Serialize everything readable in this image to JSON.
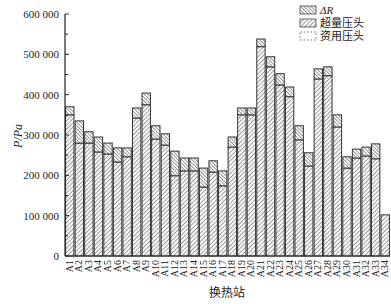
{
  "chart_data": {
    "type": "bar",
    "stacked": true,
    "title": "",
    "xlabel": "换热站",
    "ylabel": "P/Pa",
    "ylim": [
      0,
      600000
    ],
    "yticks": [
      0,
      100000,
      200000,
      300000,
      400000,
      500000,
      600000
    ],
    "ytick_labels": [
      "0",
      "100 000",
      "200 000",
      "300 000",
      "400 000",
      "500 000",
      "600 000"
    ],
    "grid": false,
    "legend_position": "top-right",
    "legend": [
      {
        "name": "ΔR",
        "pattern": "back-hatch"
      },
      {
        "name": "超量压头",
        "pattern": "forward-hatch"
      },
      {
        "name": "资用压头",
        "pattern": "dashed-empty"
      }
    ],
    "categories": [
      "A1",
      "A2",
      "A3",
      "A4",
      "A5",
      "A6",
      "A7",
      "A8",
      "A9",
      "A10",
      "A11",
      "A12",
      "A13",
      "A14",
      "A15",
      "A16",
      "A17",
      "A18",
      "A19",
      "A20",
      "A21",
      "A22",
      "A23",
      "A24",
      "A25",
      "A26",
      "A27",
      "A28",
      "A29",
      "A30",
      "A31",
      "A32",
      "A33",
      "A34"
    ],
    "series": [
      {
        "name": "超量压头",
        "values": [
          350000,
          280000,
          280000,
          258000,
          253000,
          233000,
          246000,
          342000,
          375000,
          290000,
          275000,
          199000,
          211000,
          211000,
          171000,
          208000,
          174000,
          270000,
          350000,
          350000,
          519000,
          469000,
          424000,
          395000,
          288000,
          223000,
          439000,
          447000,
          320000,
          218000,
          243000,
          248000,
          241000,
          102000
        ]
      },
      {
        "name": "ΔR",
        "values": [
          20000,
          55000,
          28000,
          37000,
          27000,
          35000,
          22000,
          25000,
          29000,
          33000,
          28000,
          61000,
          32000,
          32000,
          47000,
          28000,
          37000,
          25000,
          17000,
          17000,
          19000,
          25000,
          28000,
          24000,
          35000,
          33000,
          25000,
          22000,
          30000,
          28000,
          22000,
          22000,
          37000,
          0
        ]
      }
    ],
    "totals": [
      370000,
      335000,
      308000,
      295000,
      280000,
      268000,
      268000,
      367000,
      404000,
      323000,
      303000,
      260000,
      243000,
      243000,
      218000,
      236000,
      211000,
      295000,
      367000,
      367000,
      538000,
      494000,
      452000,
      419000,
      323000,
      256000,
      464000,
      469000,
      350000,
      246000,
      265000,
      270000,
      278000,
      102000
    ]
  }
}
